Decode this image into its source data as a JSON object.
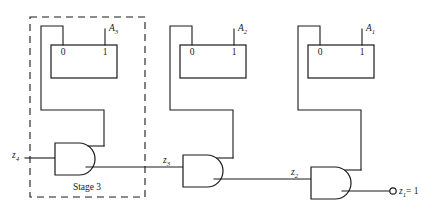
{
  "diagram": {
    "stage_frame_label": "Stage 3",
    "colors": {
      "line": "#1a1a1a",
      "background": "#ffffff"
    },
    "flipflops": [
      {
        "id": "ff-3",
        "input_label": "A",
        "input_sub": "3",
        "left_terminal": "0",
        "right_terminal": "1"
      },
      {
        "id": "ff-2",
        "input_label": "A",
        "input_sub": "2",
        "left_terminal": "0",
        "right_terminal": "1"
      },
      {
        "id": "ff-1",
        "input_label": "A",
        "input_sub": "1",
        "left_terminal": "0",
        "right_terminal": "1"
      }
    ],
    "gates": [
      {
        "id": "and-3",
        "type": "AND",
        "input_signal": "z",
        "input_sub": "4",
        "output_signal": "z",
        "output_sub": "3"
      },
      {
        "id": "and-2",
        "type": "AND",
        "input_signal": "z",
        "input_sub": "3",
        "output_signal": "z",
        "output_sub": "2"
      },
      {
        "id": "and-1",
        "type": "AND",
        "input_signal": "z",
        "input_sub": "2",
        "output_signal": "z",
        "output_sub": "1"
      }
    ],
    "signals": {
      "z4": {
        "base": "z",
        "sub": "4"
      },
      "z3": {
        "base": "z",
        "sub": "3"
      },
      "z2": {
        "base": "z",
        "sub": "2"
      },
      "z1": {
        "base": "z",
        "sub": "1"
      }
    },
    "output": {
      "base": "z",
      "sub": "1",
      "equals": "= 1",
      "full": "z1 = 1"
    }
  }
}
